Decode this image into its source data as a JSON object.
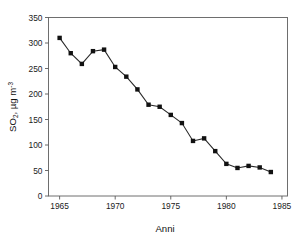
{
  "chart_data": {
    "type": "line",
    "title": "",
    "subtitle": "",
    "xlabel": "Anni",
    "ylabel": "SO2, µg m-3",
    "ylabel_parts": {
      "base": "SO",
      "subscript": "2",
      "rest": ", µg m",
      "superscript": "-3"
    },
    "x": [
      1965,
      1966,
      1967,
      1968,
      1969,
      1970,
      1971,
      1972,
      1973,
      1974,
      1975,
      1976,
      1977,
      1978,
      1979,
      1980,
      1981,
      1982,
      1983,
      1984
    ],
    "values": [
      310,
      280,
      259,
      284,
      287,
      253,
      234,
      209,
      179,
      175,
      159,
      143,
      108,
      113,
      88,
      63,
      55,
      59,
      56,
      47
    ],
    "series": [
      {
        "name": "SO2",
        "values": [
          310,
          280,
          259,
          284,
          287,
          253,
          234,
          209,
          179,
          175,
          159,
          143,
          108,
          113,
          88,
          63,
          55,
          59,
          56,
          47
        ]
      }
    ],
    "xlim": [
      1964,
      1985.5
    ],
    "ylim": [
      0,
      350
    ],
    "xticks": [
      1965,
      1970,
      1975,
      1980,
      1985
    ],
    "xtick_labels": [
      "1965",
      "1970",
      "1975",
      "1980",
      "1985"
    ],
    "yticks": [
      0,
      50,
      100,
      150,
      200,
      250,
      300,
      350
    ],
    "ytick_labels": [
      "0",
      "50",
      "100",
      "150",
      "200",
      "250",
      "300",
      "350"
    ],
    "grid": false,
    "legend": null,
    "marker": "square",
    "marker_color": "#111111",
    "line_color": "#2a2a2a",
    "frame_color": "#6e6e6e",
    "background": "#ffffff"
  }
}
